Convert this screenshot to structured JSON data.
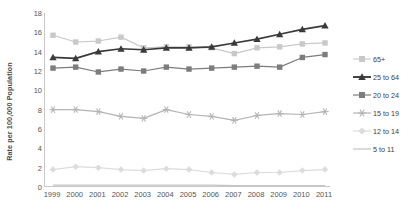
{
  "chart_data": {
    "type": "line",
    "title": "",
    "xlabel": "",
    "ylabel": "Rate per 100,000 Population",
    "categories": [
      "1999",
      "2000",
      "2001",
      "2002",
      "2003",
      "2004",
      "2005",
      "2006",
      "2007",
      "2008",
      "2009",
      "2010",
      "2011"
    ],
    "x": [
      1999,
      2000,
      2001,
      2002,
      2003,
      2004,
      2005,
      2006,
      2007,
      2008,
      2009,
      2010,
      2011
    ],
    "ylim": [
      0,
      18
    ],
    "ytick_values": [
      0,
      2,
      4,
      6,
      8,
      10,
      12,
      14,
      16,
      18
    ],
    "ytick_labels": [
      "0",
      "2",
      "4",
      "6",
      "8",
      "10",
      "12",
      "14",
      "16",
      "18"
    ],
    "grid": false,
    "legend_position": "right",
    "series": [
      {
        "name": "65+",
        "marker": "square",
        "color": "#c9c9c9",
        "line_color": "#c9c9c9",
        "values": [
          15.7,
          15.0,
          15.1,
          15.5,
          14.4,
          14.5,
          14.5,
          14.4,
          13.8,
          14.4,
          14.5,
          14.8,
          14.9
        ]
      },
      {
        "name": "25 to 64",
        "marker": "triangle",
        "color": "#3a3a3a",
        "line_color": "#3a3a3a",
        "values": [
          13.4,
          13.3,
          14.0,
          14.3,
          14.2,
          14.4,
          14.4,
          14.5,
          14.9,
          15.3,
          15.8,
          16.3,
          16.7
        ]
      },
      {
        "name": "20 to 24",
        "marker": "square",
        "color": "#7d7d7d",
        "line_color": "#7d7d7d",
        "values": [
          12.3,
          12.4,
          11.9,
          12.2,
          12.0,
          12.4,
          12.2,
          12.3,
          12.4,
          12.5,
          12.4,
          13.4,
          13.7
        ]
      },
      {
        "name": "15 to 19",
        "marker": "star",
        "color": "#b4b4b4",
        "line_color": "#b4b4b4",
        "values": [
          8.0,
          8.0,
          7.8,
          7.3,
          7.1,
          8.0,
          7.5,
          7.3,
          6.9,
          7.4,
          7.6,
          7.5,
          7.8
        ]
      },
      {
        "name": "12 to 14",
        "marker": "diamond",
        "color": "#dcdcdc",
        "line_color": "#dcdcdc",
        "values": [
          1.8,
          2.1,
          2.0,
          1.8,
          1.7,
          1.9,
          1.8,
          1.5,
          1.3,
          1.5,
          1.5,
          1.7,
          1.8
        ]
      },
      {
        "name": "5 to 11",
        "marker": "none",
        "color": "#c4c4c4",
        "line_color": "#c4c4c4",
        "values": [
          0.2,
          0.2,
          0.2,
          0.2,
          0.2,
          0.2,
          0.2,
          0.2,
          0.15,
          0.15,
          0.15,
          0.15,
          0.15
        ]
      }
    ]
  },
  "legend": {
    "items": [
      {
        "label": "65+"
      },
      {
        "label": "25 to 64"
      },
      {
        "label": "20 to 24"
      },
      {
        "label": "15 to 19"
      },
      {
        "label": "12 to 14"
      },
      {
        "label": "5 to 11"
      }
    ]
  }
}
